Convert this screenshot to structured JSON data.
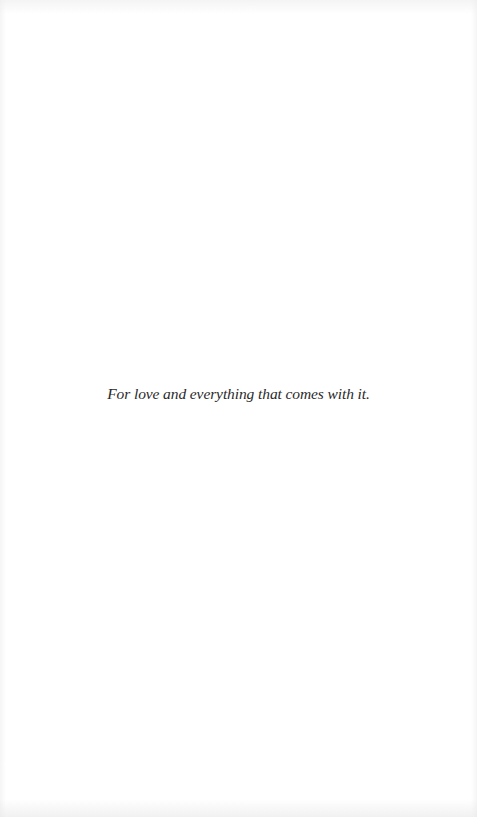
{
  "page": {
    "type": "dedication",
    "background_color": "#ffffff",
    "text_color": "#2a2a2a"
  },
  "dedication": {
    "text": "For love and everything that comes with it."
  }
}
